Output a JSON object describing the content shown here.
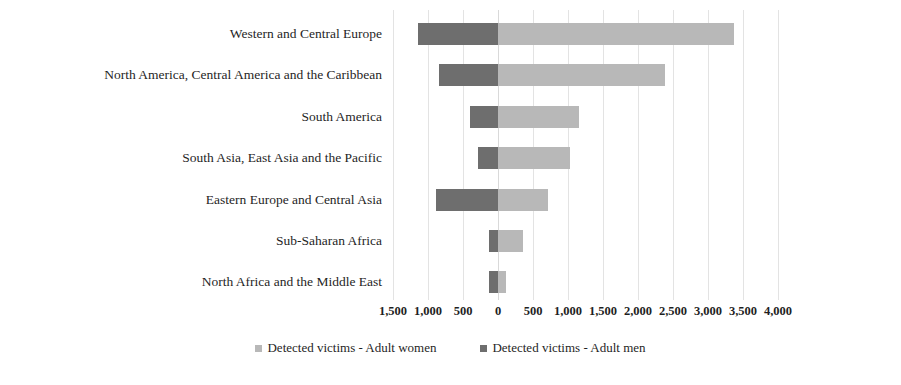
{
  "chart_data": {
    "type": "bar",
    "orientation": "horizontal",
    "stacked": "diverging",
    "title": "",
    "xlabel": "",
    "ylabel": "",
    "xlim": [
      -1500,
      4000
    ],
    "xtick_step": 500,
    "grid": true,
    "legend_position": "bottom",
    "zero_value": 0,
    "categories": [
      "Western and Central Europe",
      "North America, Central America and the Caribbean",
      "South America",
      "South Asia, East Asia and the Pacific",
      "Eastern Europe and Central Asia",
      "Sub-Saharan Africa",
      "North Africa and the Middle East"
    ],
    "series": [
      {
        "name": "Detected victims - Adult men",
        "direction": "left",
        "color": "#6e6e6e",
        "values": [
          1150,
          845,
          395,
          285,
          890,
          130,
          130
        ]
      },
      {
        "name": "Detected victims - Adult women",
        "direction": "right",
        "color": "#b8b8b8",
        "values": [
          3370,
          2385,
          1155,
          1035,
          715,
          360,
          110
        ]
      }
    ],
    "xticks": [
      {
        "label": "1,500",
        "value": -1500
      },
      {
        "label": "1,000",
        "value": -1000
      },
      {
        "label": "500",
        "value": -500
      },
      {
        "label": "0",
        "value": 0
      },
      {
        "label": "500",
        "value": 500
      },
      {
        "label": "1,000",
        "value": 1000
      },
      {
        "label": "1,500",
        "value": 1500
      },
      {
        "label": "2,000",
        "value": 2000
      },
      {
        "label": "2,500",
        "value": 2500
      },
      {
        "label": "3,000",
        "value": 3000
      },
      {
        "label": "3,500",
        "value": 3500
      },
      {
        "label": "4,000",
        "value": 4000
      }
    ],
    "legend": [
      {
        "label": "Detected victims - Adult women",
        "color": "#b8b8b8",
        "swatch": "women"
      },
      {
        "label": "Detected victims - Adult men",
        "color": "#6e6e6e",
        "swatch": "men"
      }
    ]
  },
  "colors": {
    "adult_men": "#6e6e6e",
    "adult_women": "#b8b8b8",
    "gridline": "#e3e3e3",
    "text": "#1f1f1f",
    "background": "#ffffff"
  }
}
